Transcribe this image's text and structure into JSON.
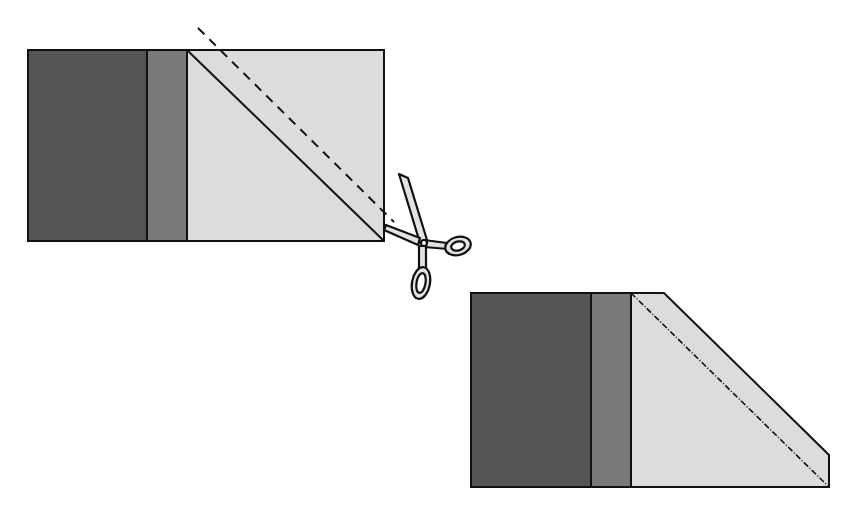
{
  "diagram": {
    "colors": {
      "background": "#ffffff",
      "dark_strip": "#555555",
      "medium_strip": "#7a7a7a",
      "light_square": "#dcdcdc",
      "outline": "#111111",
      "scissors_fill": "#e2e2e2"
    },
    "before_block": {
      "label": "",
      "x": 28,
      "y": 50,
      "width": 356,
      "height": 191,
      "dark_strip_right": 147,
      "medium_strip_right": 187,
      "stitch_line": {
        "x1": 187,
        "y1": 50,
        "x2": 384,
        "y2": 241
      },
      "cut_line": {
        "x1": 198,
        "y1": 28,
        "x2": 392,
        "y2": 222,
        "style": "dashed"
      }
    },
    "scissors": {
      "icon": "scissors-icon",
      "cx": 425,
      "cy": 243
    },
    "after_block": {
      "label": "",
      "x": 471,
      "y": 293,
      "width": 358,
      "height": 194,
      "dark_strip_right": 591,
      "medium_strip_right": 631,
      "trimmed_top_right_x": 664,
      "trimmed_right_top_y": 455,
      "seam_line": {
        "x1": 631,
        "y1": 293,
        "x2": 829,
        "y2": 487,
        "style": "dash-dot"
      }
    }
  }
}
